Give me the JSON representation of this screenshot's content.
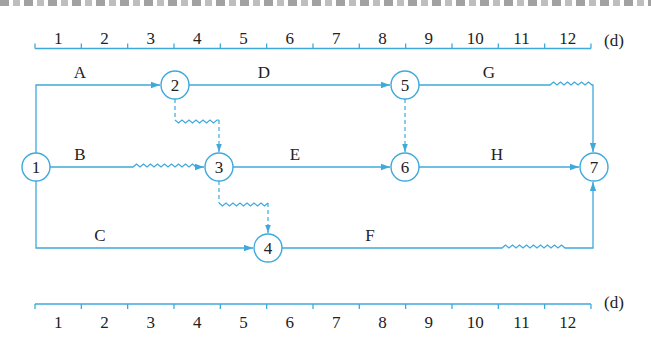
{
  "figure": {
    "type": "time-scaled double-code network diagram",
    "line_color": "#3fa9dc",
    "text_color": "#222222",
    "unit_label": "(d)"
  },
  "top_scale": {
    "ticks": [
      "1",
      "2",
      "3",
      "4",
      "5",
      "6",
      "7",
      "8",
      "9",
      "10",
      "11",
      "12"
    ],
    "unit": "(d)"
  },
  "bottom_scale": {
    "ticks": [
      "1",
      "2",
      "3",
      "4",
      "5",
      "6",
      "7",
      "8",
      "9",
      "10",
      "11",
      "12"
    ],
    "unit": "(d)"
  },
  "nodes": [
    {
      "id": "1",
      "label": "1"
    },
    {
      "id": "2",
      "label": "2"
    },
    {
      "id": "3",
      "label": "3"
    },
    {
      "id": "4",
      "label": "4"
    },
    {
      "id": "5",
      "label": "5"
    },
    {
      "id": "6",
      "label": "6"
    },
    {
      "id": "7",
      "label": "7"
    }
  ],
  "activities": [
    {
      "label": "A",
      "from": "1",
      "to": "2"
    },
    {
      "label": "B",
      "from": "1",
      "to": "3",
      "free_float": "wavy"
    },
    {
      "label": "C",
      "from": "1",
      "to": "4"
    },
    {
      "label": "D",
      "from": "2",
      "to": "5"
    },
    {
      "label": "E",
      "from": "3",
      "to": "6"
    },
    {
      "label": "F",
      "from": "4",
      "to": "7",
      "free_float": "wavy"
    },
    {
      "label": "G",
      "from": "5",
      "to": "7",
      "free_float": "wavy"
    },
    {
      "label": "H",
      "from": "6",
      "to": "7"
    }
  ],
  "dummies": [
    {
      "from": "2",
      "to": "3",
      "free_float": "wavy"
    },
    {
      "from": "3",
      "to": "4",
      "free_float": "wavy"
    },
    {
      "from": "5",
      "to": "6"
    }
  ]
}
